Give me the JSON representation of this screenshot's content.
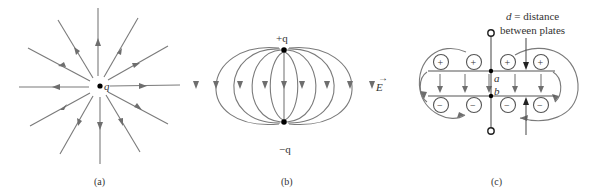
{
  "figure": {
    "panels": [
      {
        "id": "a",
        "caption": "(a)",
        "charge_label": "q",
        "description": "Radial electric field lines pointing inward toward a single charge"
      },
      {
        "id": "b",
        "caption": "(b)",
        "top_charge_label": "+q",
        "bottom_charge_label": "−q",
        "field_label": "E",
        "field_vector_arrow": "→",
        "description": "Dipole field lines from +q to −q"
      },
      {
        "id": "c",
        "caption": "(c)",
        "annotation_line1_var": "d",
        "annotation_line1_rest": " = distance",
        "annotation_line2": "between plates",
        "point_a": "a",
        "point_b": "b",
        "plus_sign": "+",
        "minus_sign": "−",
        "description": "Parallel-plate capacitor with uniform field between plates and fringing fields"
      }
    ],
    "colors": {
      "field_line": "#7a7a7a",
      "arrow": "#6e6e6e",
      "charge": "#000000",
      "background": "#ffffff"
    }
  }
}
